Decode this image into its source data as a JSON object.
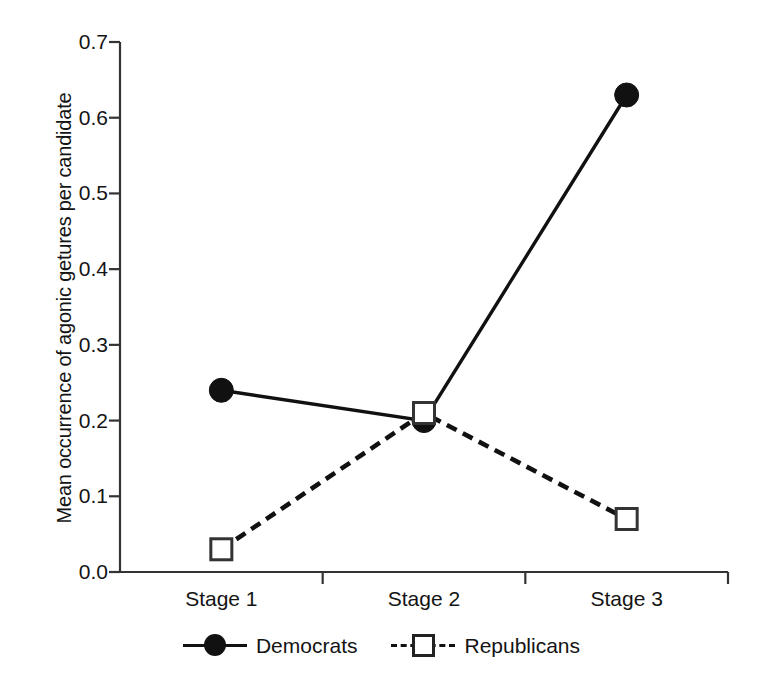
{
  "chart_data": {
    "type": "line",
    "title": "",
    "xlabel": "",
    "ylabel": "Mean occurrence of agonic getures per candidate",
    "categories": [
      "Stage 1",
      "Stage 2",
      "Stage 3"
    ],
    "series": [
      {
        "name": "Democrats",
        "values": [
          0.24,
          0.2,
          0.63
        ],
        "marker": "filled-circle",
        "linestyle": "solid",
        "color": "#111111"
      },
      {
        "name": "Republicans",
        "values": [
          0.03,
          0.21,
          0.07
        ],
        "marker": "open-square",
        "linestyle": "dashed",
        "color": "#111111"
      }
    ],
    "ylim": [
      0.0,
      0.7
    ],
    "ytick_values": [
      0.0,
      0.1,
      0.2,
      0.3,
      0.4,
      0.5,
      0.6,
      0.7
    ],
    "ytick_labels": [
      "0.0",
      "0.1",
      "0.2",
      "0.3",
      "0.4",
      "0.5",
      "0.6",
      "0.7"
    ],
    "grid": false,
    "legend_position": "bottom-center",
    "legend_entries": [
      "Democrats",
      "Republicans"
    ],
    "background_color": "#ffffff",
    "axis_color": "#333333"
  }
}
